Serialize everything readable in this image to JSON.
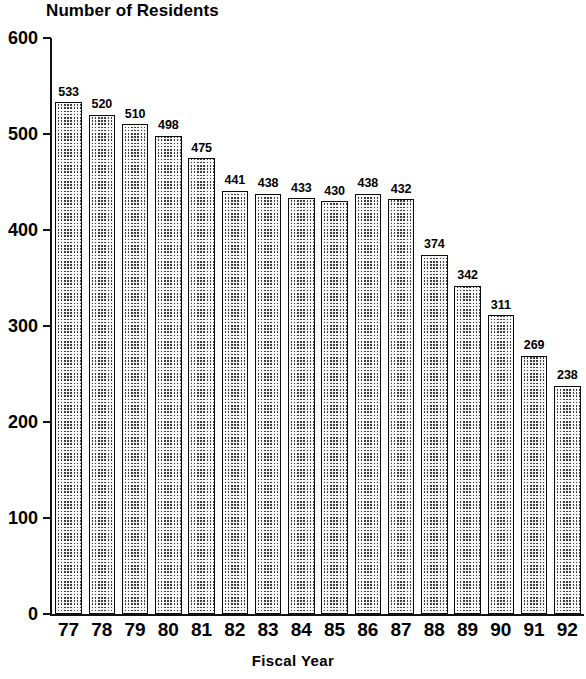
{
  "chart_data": {
    "type": "bar",
    "title": "Number of Residents",
    "xlabel": "Fiscal Year",
    "ylabel": "",
    "categories": [
      "77",
      "78",
      "79",
      "80",
      "81",
      "82",
      "83",
      "84",
      "85",
      "86",
      "87",
      "88",
      "89",
      "90",
      "91",
      "92"
    ],
    "values": [
      533,
      520,
      510,
      498,
      475,
      441,
      438,
      433,
      430,
      438,
      432,
      374,
      342,
      311,
      269,
      238
    ],
    "value_labels": [
      "533",
      "520",
      "510",
      "498",
      "475",
      "441",
      "438",
      "433",
      "430",
      "438",
      "432",
      "374",
      "342",
      "311",
      "269",
      "238"
    ],
    "ylim": [
      0,
      600
    ],
    "ytick_values": [
      0,
      100,
      200,
      300,
      400,
      500,
      600
    ],
    "ytick_labels": [
      "0",
      "100",
      "200",
      "300",
      "400",
      "500",
      "600"
    ],
    "grid": false,
    "legend": false,
    "bar_color": "#3d3d3d",
    "bar_pattern": "checkerboard-dither",
    "bar_border_color": "#0d0d0d",
    "background_color": "#ffffff",
    "axis_color": "#111111"
  }
}
